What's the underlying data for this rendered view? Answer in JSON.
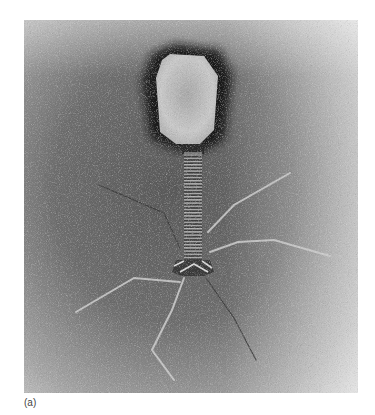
{
  "figure": {
    "caption_label": "(a)",
    "colors": {
      "background_light": "#d8d8d8",
      "background_mid": "#8a8a8a",
      "background_dark": "#4a4a4a",
      "head_halo": "#1a1a1a",
      "head_fill": "#c9c9c9",
      "tail_fibers": "#d0d0d0"
    }
  }
}
